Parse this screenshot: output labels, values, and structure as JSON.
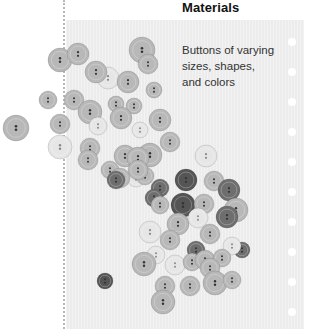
{
  "section": {
    "title": "Materials",
    "description": [
      "Buttons of varying",
      "sizes, shapes,",
      "and colors"
    ]
  },
  "illustration": {
    "subject": "scattered sewing buttons",
    "palette": {
      "light": "#e6e6e6",
      "mid": "#b8b8b8",
      "dark": "#6e6e6e",
      "darker": "#555555",
      "panel": "#ececec"
    }
  },
  "binder_holes_count": 10
}
